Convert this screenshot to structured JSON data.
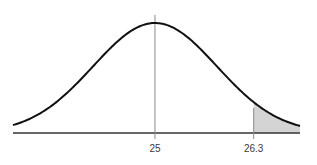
{
  "chart_data": {
    "type": "area",
    "title": "",
    "xlabel": "",
    "ylabel": "",
    "distribution": "normal",
    "mean": 25,
    "sd": 0.815,
    "xlim": [
      23.13,
      26.91
    ],
    "tick_labels": [
      "25",
      "26.3"
    ],
    "tick_values": [
      25,
      26.3
    ],
    "shaded_region": {
      "from": 26.3,
      "to": 26.91,
      "side": "right tail"
    },
    "grid": false,
    "legend": "none"
  },
  "style": {
    "curve_color": "#111111",
    "axis_color": "#333333",
    "marker_line_color": "#8a8a8a",
    "shade_color": "#d4d4d4"
  },
  "labels": {
    "mean_label": "25",
    "cutoff_label": "26.3"
  }
}
